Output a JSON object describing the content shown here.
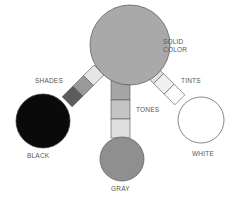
{
  "diagram": {
    "nodes": {
      "solid": {
        "label": "SOLID\nCOLOR",
        "fill": "#a9a9a9"
      },
      "black": {
        "label": "BLACK",
        "fill": "#0a0a0a"
      },
      "gray": {
        "label": "GRAY",
        "fill": "#8f8f8f"
      },
      "white": {
        "label": "WHITE",
        "fill": "#ffffff"
      }
    },
    "edges": {
      "shades": {
        "label": "SHADES",
        "from": "solid",
        "to": "black",
        "steps": [
          "#e6e6e6",
          "#9a9a9a",
          "#5c5c5c"
        ]
      },
      "tones": {
        "label": "TONES",
        "from": "solid",
        "to": "gray",
        "steps": [
          "#a5a5a5",
          "#c4c4c4",
          "#dedede"
        ]
      },
      "tints": {
        "label": "TINTS",
        "from": "solid",
        "to": "white",
        "steps": [
          "#e2e2e2",
          "#f0f0f0",
          "#ffffff"
        ]
      }
    },
    "stroke_color": "#555555"
  }
}
